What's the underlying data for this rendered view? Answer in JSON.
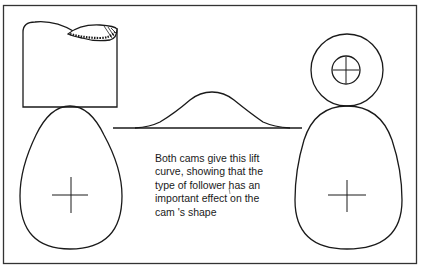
{
  "figure": {
    "caption": "Both cams give this lift\ncurve, showing that the\ntype of follower has an\nimportant effect on the\ncam 's shape",
    "parts": {
      "left_follower": "flat-faced follower (hatched top)",
      "left_cam": "egg-shaped cam with centre cross",
      "lift_curve": "bell-shaped lift curve on baseline",
      "right_follower": "roller follower with centre cross",
      "right_cam": "rounded cam with centre cross"
    },
    "colors": {
      "line": "#1a1a1a",
      "background": "#ffffff"
    }
  }
}
